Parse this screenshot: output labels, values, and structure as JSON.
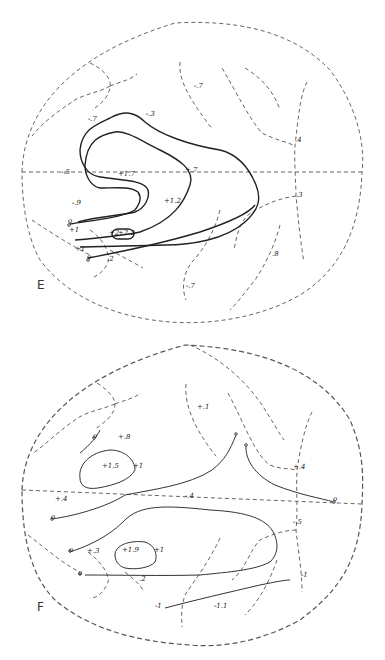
{
  "panels": [
    {
      "id": "E",
      "letter": "E",
      "labels": [
        {
          "text": "-.7",
          "x": 88,
          "y": 120
        },
        {
          "text": "-.3",
          "x": 146,
          "y": 115
        },
        {
          "text": "-.7",
          "x": 194,
          "y": 87
        },
        {
          "text": "-.5",
          "x": 61,
          "y": 173
        },
        {
          "text": "+1.7",
          "x": 118,
          "y": 175
        },
        {
          "text": "+.7",
          "x": 185,
          "y": 171
        },
        {
          "text": "-.9",
          "x": 72,
          "y": 204
        },
        {
          "text": "+1.2",
          "x": 164,
          "y": 202
        },
        {
          "text": "o",
          "x": 68,
          "y": 222
        },
        {
          "text": "+1",
          "x": 69,
          "y": 231
        },
        {
          "text": "+2",
          "x": 109,
          "y": 234
        },
        {
          "text": "+2.2",
          "x": 118,
          "y": 234
        },
        {
          "text": "+1",
          "x": 75,
          "y": 250
        },
        {
          "text": "o",
          "x": 87,
          "y": 258
        },
        {
          "text": ".2",
          "x": 107,
          "y": 260
        },
        {
          "text": ".4",
          "x": 295,
          "y": 141
        },
        {
          "text": ".3",
          "x": 296,
          "y": 196
        },
        {
          "text": ".8",
          "x": 272,
          "y": 255
        },
        {
          "text": "-.7",
          "x": 186,
          "y": 287
        }
      ]
    },
    {
      "id": "F",
      "letter": "F",
      "labels": [
        {
          "text": "+.1",
          "x": 197,
          "y": 408
        },
        {
          "text": "o",
          "x": 93,
          "y": 437
        },
        {
          "text": "+.8",
          "x": 118,
          "y": 438
        },
        {
          "text": "+1.5",
          "x": 102,
          "y": 467
        },
        {
          "text": "+1",
          "x": 133,
          "y": 467
        },
        {
          "text": "+.4",
          "x": 293,
          "y": 468
        },
        {
          "text": "+.4",
          "x": 55,
          "y": 500
        },
        {
          "text": "-.4",
          "x": 185,
          "y": 497
        },
        {
          "text": "o",
          "x": 51,
          "y": 518
        },
        {
          "text": "o",
          "x": 333,
          "y": 500
        },
        {
          "text": "-.5",
          "x": 293,
          "y": 523
        },
        {
          "text": "o",
          "x": 69,
          "y": 551
        },
        {
          "text": "+.3",
          "x": 87,
          "y": 552
        },
        {
          "text": "+1.9",
          "x": 122,
          "y": 551
        },
        {
          "text": "+1",
          "x": 154,
          "y": 551
        },
        {
          "text": "o",
          "x": 78,
          "y": 574
        },
        {
          "text": ".2",
          "x": 139,
          "y": 580
        },
        {
          "text": "-1",
          "x": 301,
          "y": 576
        },
        {
          "text": "-1",
          "x": 155,
          "y": 607
        },
        {
          "text": "-1.1",
          "x": 214,
          "y": 607
        }
      ]
    }
  ]
}
